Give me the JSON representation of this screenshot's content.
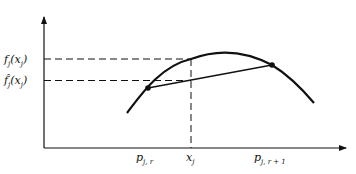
{
  "diagram": {
    "y_axis_labels": {
      "f_value": {
        "base": "f",
        "sub": "j",
        "arg": "(x",
        "arg_sub": "j",
        "close": ")"
      },
      "f_hat_value": {
        "base": "f̂",
        "sub": "j",
        "arg": "(x",
        "arg_sub": "j",
        "close": ")"
      }
    },
    "x_axis_labels": {
      "p_left": {
        "base": "p",
        "sub": "j, r"
      },
      "x_point": {
        "base": "x",
        "sub": "j"
      },
      "p_right": {
        "base": "p",
        "sub": "j, r + 1"
      }
    },
    "colors": {
      "ink": "#111111",
      "background": "#ffffff"
    }
  }
}
